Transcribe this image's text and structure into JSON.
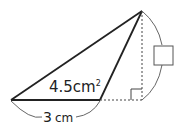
{
  "diagram": {
    "type": "geometry-triangle",
    "area_label": "4.5cm²",
    "area_value": "4.5",
    "area_unit": "cm",
    "area_exp": "2",
    "base_label": "3 cm",
    "base_value": "3",
    "base_unit": "cm",
    "height_label": "",
    "height_placeholder": "blank-box",
    "colors": {
      "stroke": "#222222",
      "dotted": "#444444",
      "box": "#555555",
      "arc": "#666666"
    }
  }
}
